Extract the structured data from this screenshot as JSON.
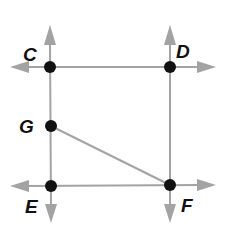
{
  "diagram": {
    "type": "geometry",
    "colors": {
      "line": "#a3a3a3",
      "point": "#111111",
      "label": "#111111",
      "background": "#ffffff"
    },
    "points": [
      {
        "label": "C",
        "x": 50,
        "y": 67
      },
      {
        "label": "D",
        "x": 170,
        "y": 67
      },
      {
        "label": "G",
        "x": 51,
        "y": 126
      },
      {
        "label": "E",
        "x": 51,
        "y": 186
      },
      {
        "label": "F",
        "x": 170,
        "y": 185
      }
    ],
    "lines": [
      {
        "name": "line-CD",
        "through": [
          "C",
          "D"
        ],
        "orientation": "horizontal",
        "arrows": "both"
      },
      {
        "name": "line-EF",
        "through": [
          "E",
          "F"
        ],
        "orientation": "horizontal",
        "arrows": "both"
      },
      {
        "name": "line-CE",
        "through": [
          "C",
          "G",
          "E"
        ],
        "orientation": "vertical",
        "arrows": "both"
      },
      {
        "name": "line-DF",
        "through": [
          "D",
          "F"
        ],
        "orientation": "vertical",
        "arrows": "both"
      }
    ],
    "segments": [
      {
        "name": "segment-GF",
        "from": "G",
        "to": "F"
      }
    ],
    "labels": {
      "C": "C",
      "D": "D",
      "G": "G",
      "E": "E",
      "F": "F"
    }
  }
}
